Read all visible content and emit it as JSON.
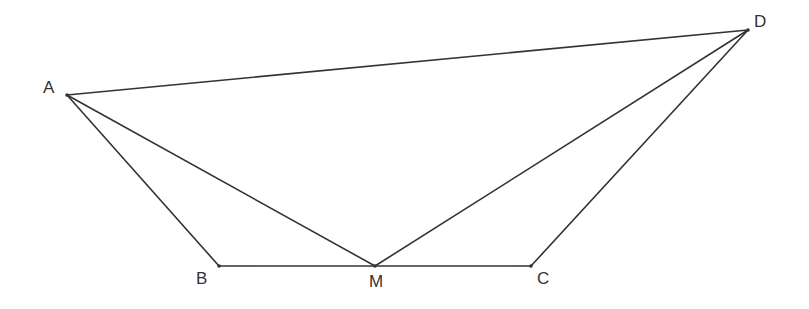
{
  "diagram": {
    "type": "geometry",
    "points": {
      "A": {
        "label": "A",
        "x": 67,
        "y": 95,
        "lx": 43,
        "ly": 93
      },
      "B": {
        "label": "B",
        "x": 219,
        "y": 266,
        "lx": 196,
        "ly": 284
      },
      "M": {
        "label": "M",
        "x": 375,
        "y": 266,
        "lx": 369,
        "ly": 287
      },
      "C": {
        "label": "C",
        "x": 531,
        "y": 266,
        "lx": 537,
        "ly": 284
      },
      "D": {
        "label": "D",
        "x": 748,
        "y": 30,
        "lx": 754,
        "ly": 27
      }
    },
    "segments": [
      [
        "A",
        "D"
      ],
      [
        "A",
        "B"
      ],
      [
        "A",
        "M"
      ],
      [
        "B",
        "C"
      ],
      [
        "M",
        "D"
      ],
      [
        "C",
        "D"
      ]
    ]
  }
}
